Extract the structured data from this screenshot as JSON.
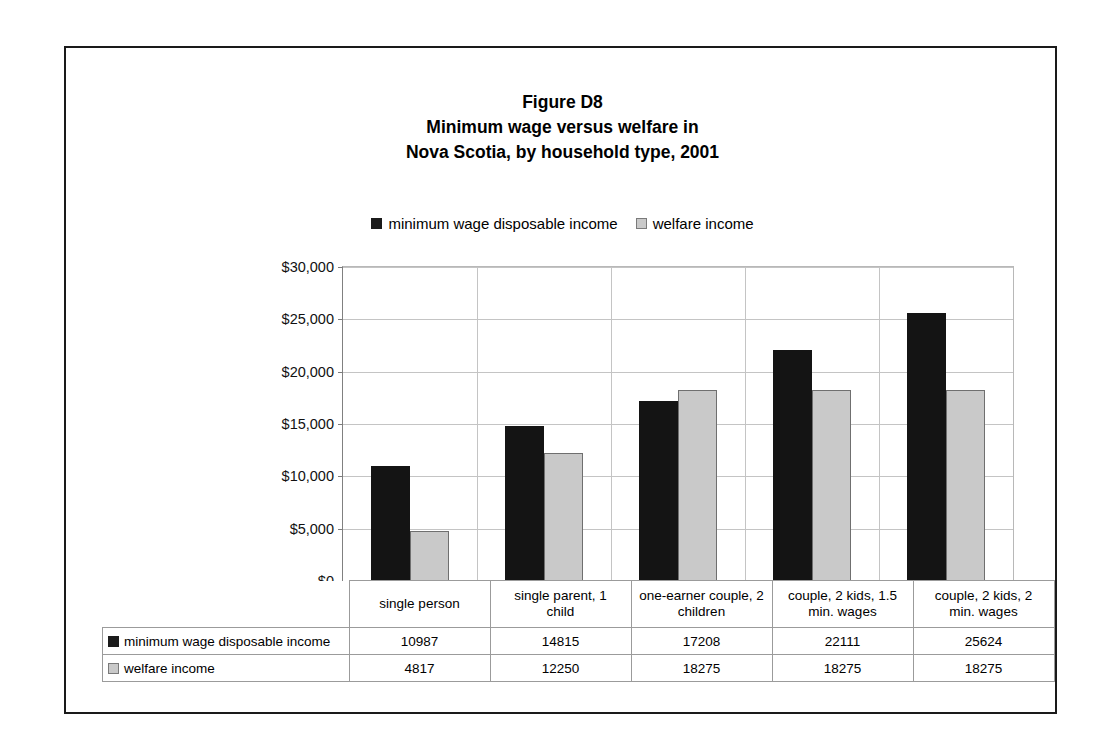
{
  "figure": {
    "title_lines": [
      "Figure D8",
      "Minimum wage versus welfare in",
      "Nova Scotia, by household type, 2001"
    ]
  },
  "chart_data": {
    "type": "bar",
    "title": "Figure D8 Minimum wage versus welfare in Nova Scotia, by household type, 2001",
    "xlabel": "",
    "ylabel": "",
    "ylim": [
      0,
      30000
    ],
    "grid": true,
    "legend_position": "top-center",
    "categories": [
      "single person",
      "single parent, 1 child",
      "one-earner couple, 2 children",
      "couple, 2 kids, 1.5 min. wages",
      "couple, 2 kids, 2 min. wages"
    ],
    "category_label_lines": [
      [
        "single person"
      ],
      [
        "single parent, 1",
        "child"
      ],
      [
        "one-earner couple, 2",
        "children"
      ],
      [
        "couple, 2 kids, 1.5",
        "min. wages"
      ],
      [
        "couple, 2 kids, 2",
        "min. wages"
      ]
    ],
    "series": [
      {
        "name": "minimum wage disposable income",
        "color": "#141414",
        "values": [
          10987,
          14815,
          17208,
          22111,
          25624
        ]
      },
      {
        "name": "welfare income",
        "color": "#c9c9c9",
        "values": [
          4817,
          12250,
          18275,
          18275,
          18275
        ]
      }
    ],
    "y_ticks": [
      0,
      5000,
      10000,
      15000,
      20000,
      25000,
      30000
    ],
    "y_tick_labels": [
      "$0",
      "$5,000",
      "$10,000",
      "$15,000",
      "$20,000",
      "$25,000",
      "$30,000"
    ]
  },
  "legend": {
    "entries": [
      {
        "label": "minimum wage disposable income",
        "swatch": "series-dark"
      },
      {
        "label": "welfare income",
        "swatch": "series-light"
      }
    ]
  },
  "data_table": {
    "rows": [
      {
        "key": "minimum wage disposable income",
        "swatch": "series-dark",
        "values": [
          "10987",
          "14815",
          "17208",
          "22111",
          "25624"
        ]
      },
      {
        "key": "welfare income",
        "swatch": "series-light",
        "values": [
          "4817",
          "12250",
          "18275",
          "18275",
          "18275"
        ]
      }
    ]
  }
}
